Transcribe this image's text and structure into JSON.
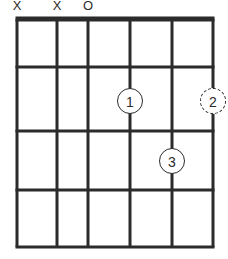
{
  "diagram": {
    "type": "guitar-chord-diagram",
    "width": 228,
    "height": 259,
    "string_count": 6,
    "fret_count": 4,
    "line_color": "#2b2b2b",
    "background_color": "#ffffff",
    "string_positions_px": [
      17,
      57,
      88,
      130,
      172,
      213
    ],
    "fret_line_positions_px": [
      19,
      67,
      131,
      190,
      247
    ],
    "nut_thickness_px": 5,
    "fret_thickness_px": 3,
    "string_thickness_px": 3
  },
  "string_markers": [
    {
      "string": 1,
      "symbol": "X",
      "meaning": "muted",
      "x": 17
    },
    {
      "string": 2,
      "symbol": "X",
      "meaning": "muted",
      "x": 57
    },
    {
      "string": 3,
      "symbol": "O",
      "meaning": "open",
      "x": 88
    }
  ],
  "finger_positions": [
    {
      "label": "1",
      "string": 4,
      "fret": 2,
      "x": 130,
      "y": 101,
      "ring_style": "solid"
    },
    {
      "label": "2",
      "string": 6,
      "fret": 2,
      "x": 213,
      "y": 101,
      "ring_style": "dashed"
    },
    {
      "label": "3",
      "string": 5,
      "fret": 3,
      "x": 172,
      "y": 161,
      "ring_style": "solid"
    }
  ]
}
